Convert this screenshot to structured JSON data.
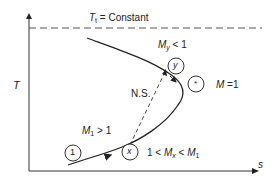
{
  "diagram": {
    "type": "Fanno line T-s diagram",
    "axes": {
      "y_label": "T",
      "x_label": "s"
    },
    "reference_line": {
      "label_sym": "T",
      "label_sub": "t",
      "label_rest": " = Constant"
    },
    "states": [
      {
        "id": "1",
        "label": "1"
      },
      {
        "id": "x",
        "label": "x"
      },
      {
        "id": "y",
        "label": "y"
      },
      {
        "id": "star",
        "label": "*"
      }
    ],
    "annotations": {
      "m1": {
        "sym": "M",
        "sub": "1",
        "rest": " > 1"
      },
      "mx": {
        "pre": "1 < ",
        "sym": "M",
        "sub": "x",
        "mid": " < ",
        "sym2": "M",
        "sub2": "1"
      },
      "my": {
        "sym": "M",
        "sub": "y",
        "rest": " < 1"
      },
      "mstar": {
        "sym": "M",
        "rest": " =1"
      },
      "ns": "N.S."
    },
    "colors": {
      "line": "#222222",
      "dashed": "#555555"
    }
  }
}
